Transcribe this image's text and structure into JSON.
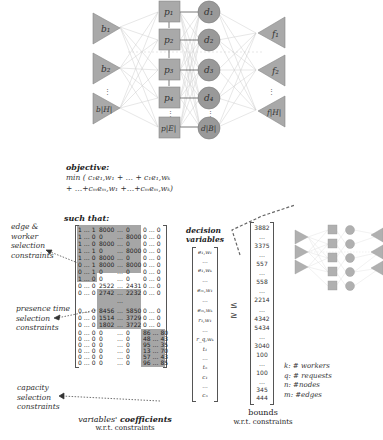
{
  "network": {
    "b_nodes": [
      "b₁",
      "b₂",
      "b|H|"
    ],
    "p_nodes": [
      "p₁",
      "p₂",
      "p₃",
      "p₄",
      "p|E|"
    ],
    "d_nodes": [
      "d₁",
      "d₂",
      "d₃",
      "d₄",
      "d|B|"
    ],
    "f_nodes": [
      "f₁",
      "f₂",
      "f|H|"
    ],
    "ellipsis": "⋮",
    "colors": {
      "node_fill": "#a9a9a9",
      "node_stroke": "#7a7a7a",
      "edge": "#c8c8c8",
      "matrix_shade": "#a6a6a6"
    }
  },
  "objective": {
    "title": "objective:",
    "line1": "min ( c₁e₁,w₁ + … + c₁e₁,wₖ",
    "line2": "+ …+cₘeₘ,w₁ +…+cₘeₘ,wₖ)"
  },
  "such_that": "such that:",
  "labels": {
    "edge_worker": [
      "edge &",
      "worker",
      "selection",
      "constraints"
    ],
    "presence_time": [
      "presence time",
      "selection",
      "constraints"
    ],
    "capacity": [
      "capacity",
      "selection",
      "constraints"
    ]
  },
  "matrix": {
    "rows": [
      [
        "1 … 1",
        "8000",
        "…",
        "0",
        "0 … 0"
      ],
      [
        "1 … 0",
        "0",
        "…",
        "8000",
        "0 … 0"
      ],
      [
        "1 … 0",
        "8000",
        "…",
        "0",
        "0 … 0"
      ],
      [
        "1 … 1",
        "0",
        "…",
        "8000",
        "0 … 0"
      ],
      [
        "1 … 0",
        "8000",
        "…",
        "0",
        "0 … 0"
      ],
      [
        "0 … 1",
        "8000",
        "…",
        "8000",
        "0 … 0"
      ],
      [
        "0 … 1",
        "0",
        "…",
        "0",
        "0 … 0"
      ],
      [
        "1 … 0",
        "0",
        "…",
        "0",
        "0 … 0"
      ],
      [
        "0 … 0",
        "2522",
        "…",
        "2431",
        "0 … 0"
      ],
      [
        "0 … 0",
        "2742",
        "…",
        "2232",
        "0 … 0"
      ],
      [
        "",
        "",
        "…",
        "",
        ""
      ],
      [
        "0 … 0",
        "8456",
        "…",
        "5850",
        "0 … 0"
      ],
      [
        "0 … 0",
        "1514",
        "…",
        "3729",
        "0 … 0"
      ],
      [
        "0 … 0",
        "1802",
        "…",
        "3722",
        "0 … 0"
      ],
      [
        "0 … 0",
        "0",
        "…",
        "0",
        "86 … 80"
      ],
      [
        "0 … 0",
        "0",
        "…",
        "0",
        "48 … 43"
      ],
      [
        "0 … 0",
        "0",
        "…",
        "0",
        "95 … 35"
      ],
      [
        "0 … 0",
        "0",
        "…",
        "0",
        "13 … 70"
      ],
      [
        "0 … 0",
        "0",
        "…",
        "0",
        "57 … 43"
      ],
      [
        "0 … 0",
        "0",
        "…",
        "0",
        "96 … 85"
      ]
    ],
    "caption_italic": "variables'",
    "caption_bold": "coefficients",
    "caption_sub": "w.r.t. constraints"
  },
  "decision_variables": {
    "title_line1": "decision",
    "title_line2": "variables",
    "items": [
      "e₁,w₁",
      "…",
      "e₁,wₖ",
      "…",
      "eₘ,w₁",
      "…",
      "eₘ,wₖ",
      "r₁,w₁",
      "…",
      "r_q,wₖ",
      "t₁",
      "…",
      "tₙ",
      "c₁",
      "…",
      "cₙ"
    ]
  },
  "inequality": {
    "le": "≤",
    "ge": "≥"
  },
  "bounds": {
    "items": [
      "3882",
      "…",
      "3375",
      "…",
      "557",
      "…",
      "558",
      "…",
      "2214",
      "…",
      "4342",
      "5434",
      "…",
      "3040",
      "100",
      "…",
      "100",
      "…",
      "345",
      "444"
    ],
    "caption": "bounds",
    "caption_sub": "w.r.t. constraints"
  },
  "legend": {
    "items": [
      "k: # workers",
      "q: # requests",
      "n: #nodes",
      "m: #edges"
    ]
  }
}
